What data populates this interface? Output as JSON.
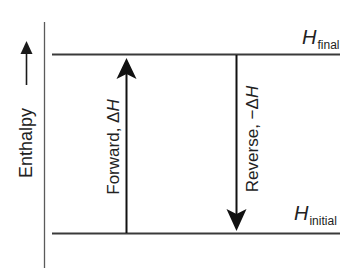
{
  "diagram": {
    "type": "enthalpy-level-diagram",
    "axis": {
      "label": "Enthalpy",
      "direction": "up"
    },
    "levels": {
      "final": {
        "symbol": "H",
        "subscript": "final"
      },
      "initial": {
        "symbol": "H",
        "subscript": "initial"
      }
    },
    "arrows": {
      "forward": {
        "label_prefix": "Forward, ",
        "label_delta": "Δ",
        "label_symbol": "H",
        "direction": "up",
        "from": "initial",
        "to": "final"
      },
      "reverse": {
        "label_prefix": "Reverse, ",
        "label_delta": "−Δ",
        "label_symbol": "H",
        "direction": "down",
        "from": "final",
        "to": "initial"
      }
    },
    "colors": {
      "line": "#1a1a1a",
      "axis_line": "#555555",
      "level_line": "#3a3a3a",
      "background": "#ffffff"
    }
  }
}
